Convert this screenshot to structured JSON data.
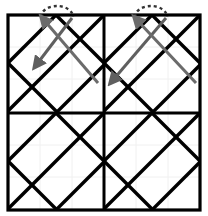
{
  "figure": {
    "width": 208,
    "height": 216,
    "background_color": "#ffffff"
  },
  "colors": {
    "lattice_stroke": "#000000",
    "frame_stroke": "#000000",
    "faint_grid": "#f0f0f0",
    "arrow_stroke": "#5f5f5f",
    "arrow_stroke_dark": "#4a4a4a",
    "dashed_arc": "#333333"
  },
  "frame": {
    "name": "outer-square-frame",
    "x": 8,
    "y": 15,
    "width": 192,
    "height": 195,
    "stroke_width": 3.2,
    "midline_x": 104,
    "midline_y": 113,
    "midline_stroke_width": 3.0
  },
  "faint_grid": {
    "name": "faint-background-grid",
    "spacing": 32,
    "stroke_width": 1,
    "x_lines": [
      40,
      72,
      104,
      136,
      168
    ],
    "y_lines": [
      47,
      79,
      113,
      145,
      177
    ]
  },
  "lattice": {
    "name": "diagonal-lattice",
    "description": "45 degree diagonal lines forming diamonds, repeated per quadrant",
    "stroke_width": 3.4,
    "cell_size": 48,
    "quadrants": [
      {
        "name": "top-left-quadrant",
        "x": 8,
        "y": 15,
        "width": 96,
        "height": 98
      },
      {
        "name": "top-right-quadrant",
        "x": 104,
        "y": 15,
        "width": 96,
        "height": 98
      },
      {
        "name": "bottom-left-quadrant",
        "x": 8,
        "y": 113,
        "width": 96,
        "height": 97
      },
      {
        "name": "bottom-right-quadrant",
        "x": 104,
        "y": 113,
        "width": 96,
        "height": 97
      }
    ]
  },
  "annotations": {
    "name": "rotation-annotations",
    "items": [
      {
        "name": "annotation-left",
        "arc": {
          "name": "dashed-rotation-arc-left",
          "cx": 57,
          "cy": 16,
          "rx": 16,
          "ry": 11,
          "dash": "3 3",
          "stroke_width": 2.4
        },
        "arrows": [
          {
            "name": "arrow-left-down",
            "from_x": 72,
            "from_y": 18,
            "to_x": 37,
            "to_y": 64,
            "head": "to",
            "stroke_width": 3.0,
            "color": "#5f5f5f"
          },
          {
            "name": "arrow-left-up",
            "from_x": 98,
            "from_y": 83,
            "to_x": 44,
            "to_y": 20,
            "head": "to",
            "stroke_width": 3.0,
            "color": "#6b6b6b"
          }
        ]
      },
      {
        "name": "annotation-right",
        "arc": {
          "name": "dashed-rotation-arc-right",
          "cx": 151,
          "cy": 16,
          "rx": 16,
          "ry": 11,
          "dash": "3 3",
          "stroke_width": 2.4
        },
        "arrows": [
          {
            "name": "arrow-right-down",
            "from_x": 166,
            "from_y": 18,
            "to_x": 113,
            "to_y": 80,
            "head": "to",
            "stroke_width": 3.0,
            "color": "#5f5f5f"
          },
          {
            "name": "arrow-right-up",
            "from_x": 196,
            "from_y": 83,
            "to_x": 137,
            "to_y": 20,
            "head": "to",
            "stroke_width": 3.0,
            "color": "#6b6b6b"
          }
        ]
      }
    ]
  }
}
